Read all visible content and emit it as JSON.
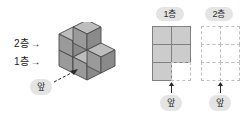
{
  "left_diagram": {
    "name": "isometric-cube-structure",
    "level_labels": [
      {
        "text": "2층",
        "arrow": "→"
      },
      {
        "text": "1층",
        "arrow": "→"
      }
    ],
    "front_label": "앞",
    "cube_colors": {
      "top": "#bdbdbd",
      "left": "#9a9a9a",
      "right": "#8a8a8a",
      "outline": "#4a4a4a"
    }
  },
  "right_diagrams": {
    "floors": [
      {
        "title": "1층",
        "front_label": "앞",
        "rows": 3,
        "cols": 2,
        "cells": [
          [
            true,
            true
          ],
          [
            true,
            true
          ],
          [
            true,
            false
          ]
        ]
      },
      {
        "title": "2층",
        "front_label": "앞",
        "rows": 3,
        "cols": 2,
        "cells": [
          [
            false,
            false
          ],
          [
            false,
            false
          ],
          [
            false,
            false
          ]
        ]
      }
    ]
  },
  "palette": {
    "pill_bg": "#e4e4e4",
    "filled_cell": "#cccccc",
    "filled_border": "#808080",
    "empty_border": "#bfbfbf",
    "text": "#1a1a1a",
    "background": "#ffffff"
  }
}
